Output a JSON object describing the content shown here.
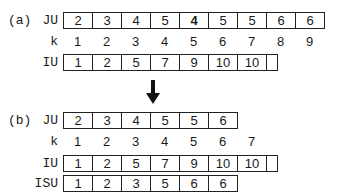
{
  "panel_a": {
    "tag": "(a)",
    "rows": {
      "JU": {
        "label": "JU",
        "values": [
          "2",
          "3",
          "4",
          "5",
          "4",
          "5",
          "5",
          "6",
          "6"
        ]
      },
      "k": {
        "label": "k",
        "values": [
          "1",
          "2",
          "3",
          "4",
          "5",
          "6",
          "7",
          "8",
          "9"
        ]
      },
      "IU": {
        "label": "IU",
        "values": [
          "1",
          "2",
          "5",
          "7",
          "9",
          "10",
          "10"
        ]
      }
    }
  },
  "arrow": {
    "icon": "down-arrow-icon",
    "color": "#111111"
  },
  "panel_b": {
    "tag": "(b)",
    "rows": {
      "JU": {
        "label": "JU",
        "values": [
          "2",
          "3",
          "4",
          "5",
          "5",
          "6"
        ]
      },
      "k": {
        "label": "k",
        "values": [
          "1",
          "2",
          "3",
          "4",
          "5",
          "6",
          "7"
        ]
      },
      "IU": {
        "label": "IU",
        "values": [
          "1",
          "2",
          "5",
          "7",
          "9",
          "10",
          "10"
        ]
      },
      "ISU": {
        "label": "ISU",
        "values": [
          "1",
          "2",
          "3",
          "5",
          "6",
          "6"
        ]
      }
    }
  }
}
